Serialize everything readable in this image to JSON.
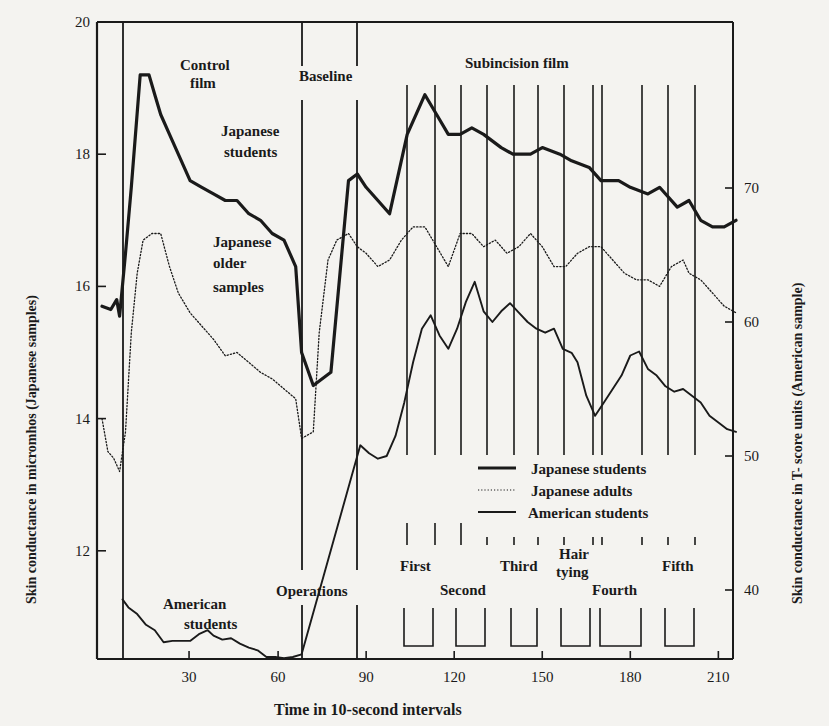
{
  "chart_data": {
    "type": "line",
    "title": "",
    "xlabel": "Time in 10-second intervals",
    "ylabel_left": "Skin conductance in micromhos (Japanese samples)",
    "ylabel_right": "Skin conductance in T- score units (American sample)",
    "x_ticks": [
      30,
      60,
      90,
      120,
      150,
      180,
      210
    ],
    "xlim": [
      0,
      216
    ],
    "y_left_ticks": [
      12,
      14,
      16,
      18,
      20
    ],
    "y_left_lim": [
      10.4,
      20
    ],
    "y_right_ticks": [
      40,
      50,
      60,
      70
    ],
    "y_right_lim": [
      35,
      82
    ],
    "grid": false,
    "legend_position": "center-right, inside plot",
    "legend": [
      {
        "label": "Japanese students",
        "style": "thick solid"
      },
      {
        "label": "Japanese adults",
        "style": "dotted"
      },
      {
        "label": "American students",
        "style": "thin solid"
      }
    ],
    "phase_markers_x": [
      7,
      68,
      87
    ],
    "segment_markers_x": [
      104,
      114,
      122,
      131,
      141,
      149,
      158,
      168,
      171,
      184,
      194,
      203
    ],
    "bottom_brackets": [
      [
        104,
        114
      ],
      [
        122,
        131
      ],
      [
        141,
        149
      ],
      [
        158,
        168
      ],
      [
        171,
        184
      ],
      [
        194,
        203
      ]
    ],
    "annotations": [
      {
        "text": "Control film",
        "lines": [
          "Control",
          "film"
        ]
      },
      {
        "text": "Japanese students",
        "lines": [
          "Japanese",
          "students"
        ]
      },
      {
        "text": "Japanese older samples",
        "lines": [
          "Japanese",
          "older",
          "samples"
        ]
      },
      {
        "text": "American students",
        "lines": [
          "American",
          "students"
        ]
      },
      {
        "text": "Baseline"
      },
      {
        "text": "Subincision film"
      },
      {
        "text": "Operations"
      },
      {
        "text": "First"
      },
      {
        "text": "Second"
      },
      {
        "text": "Third"
      },
      {
        "text": "Hair tying",
        "lines": [
          "Hair",
          "tying"
        ]
      },
      {
        "text": "Fourth"
      },
      {
        "text": "Fifth"
      }
    ],
    "series": [
      {
        "name": "Japanese students",
        "axis": "left",
        "unit": "micromhos",
        "x": [
          0,
          3,
          5,
          6,
          8,
          10,
          13,
          16,
          18,
          20,
          23,
          26,
          30,
          34,
          38,
          42,
          46,
          50,
          54,
          58,
          62,
          66,
          68,
          72,
          78,
          84,
          87,
          90,
          94,
          98,
          104,
          110,
          114,
          118,
          122,
          126,
          130,
          136,
          140,
          146,
          150,
          156,
          160,
          166,
          170,
          176,
          180,
          186,
          190,
          196,
          200,
          204,
          208,
          212,
          216
        ],
        "values": [
          15.7,
          15.65,
          15.8,
          15.55,
          16.5,
          17.5,
          19.2,
          19.2,
          18.9,
          18.6,
          18.3,
          18.0,
          17.6,
          17.5,
          17.4,
          17.3,
          17.3,
          17.1,
          17.0,
          16.8,
          16.7,
          16.3,
          15.0,
          14.5,
          14.7,
          17.6,
          17.7,
          17.5,
          17.3,
          17.1,
          18.3,
          18.9,
          18.6,
          18.3,
          18.3,
          18.4,
          18.3,
          18.1,
          18.0,
          18.0,
          18.1,
          18.0,
          17.9,
          17.8,
          17.6,
          17.6,
          17.5,
          17.4,
          17.5,
          17.2,
          17.3,
          17.0,
          16.9,
          16.9,
          17.0
        ]
      },
      {
        "name": "Japanese adults",
        "axis": "left",
        "unit": "micromhos",
        "x": [
          0,
          2,
          4,
          6,
          8,
          10,
          12,
          14,
          17,
          20,
          23,
          26,
          30,
          34,
          38,
          42,
          46,
          50,
          54,
          58,
          62,
          66,
          68,
          72,
          74,
          77,
          80,
          84,
          87,
          90,
          94,
          98,
          102,
          106,
          110,
          114,
          118,
          122,
          126,
          130,
          134,
          138,
          142,
          146,
          150,
          154,
          158,
          162,
          166,
          170,
          174,
          178,
          182,
          186,
          190,
          194,
          198,
          200,
          204,
          208,
          212,
          216
        ],
        "values": [
          14.0,
          13.5,
          13.4,
          13.2,
          13.8,
          15.3,
          16.2,
          16.7,
          16.8,
          16.8,
          16.3,
          15.9,
          15.6,
          15.4,
          15.2,
          14.95,
          15.0,
          14.85,
          14.7,
          14.6,
          14.45,
          14.3,
          13.7,
          13.8,
          15.3,
          16.4,
          16.7,
          16.8,
          16.6,
          16.5,
          16.3,
          16.4,
          16.7,
          16.9,
          16.9,
          16.6,
          16.3,
          16.8,
          16.8,
          16.6,
          16.7,
          16.5,
          16.6,
          16.8,
          16.6,
          16.3,
          16.3,
          16.5,
          16.6,
          16.6,
          16.4,
          16.2,
          16.1,
          16.1,
          16.0,
          16.3,
          16.4,
          16.2,
          16.1,
          15.9,
          15.7,
          15.6
        ]
      },
      {
        "name": "American students",
        "axis": "right",
        "unit": "T-score",
        "x": [
          7,
          9,
          12,
          15,
          18,
          21,
          24,
          27,
          30,
          33,
          36,
          38,
          41,
          44,
          47,
          50,
          53,
          56,
          59,
          62,
          65,
          68,
          88,
          91,
          94,
          97,
          100,
          103,
          106,
          109,
          112,
          115,
          118,
          121,
          124,
          127,
          130,
          133,
          136,
          139,
          142,
          145,
          148,
          151,
          154,
          157,
          160,
          162,
          165,
          168,
          171,
          174,
          177,
          180,
          183,
          186,
          189,
          192,
          195,
          198,
          201,
          204,
          207,
          210,
          213,
          216
        ],
        "values": [
          39.3,
          38.7,
          38.2,
          37.4,
          37.0,
          36.1,
          36.2,
          36.2,
          36.2,
          36.7,
          37.0,
          36.6,
          36.3,
          36.4,
          36.0,
          35.7,
          35.5,
          35.0,
          35.0,
          34.9,
          35.0,
          35.2,
          50.8,
          50.2,
          49.8,
          50.0,
          51.5,
          54.0,
          57.0,
          59.5,
          60.5,
          59.0,
          58.0,
          59.5,
          61.5,
          63.0,
          60.8,
          60.0,
          60.8,
          61.4,
          60.7,
          60.0,
          59.5,
          59.2,
          59.5,
          58.0,
          57.7,
          57.0,
          54.5,
          53.0,
          54.0,
          55.0,
          56.0,
          57.5,
          57.8,
          56.5,
          56.0,
          55.2,
          54.8,
          55.0,
          54.5,
          54.0,
          53.0,
          52.5,
          52.0,
          51.8
        ]
      }
    ]
  },
  "labels": {
    "control_film_1": "Control",
    "control_film_2": "film",
    "baseline": "Baseline",
    "subincision": "Subincision film",
    "jp_students_1": "Japanese",
    "jp_students_2": "students",
    "jp_older_1": "Japanese",
    "jp_older_2": "older",
    "jp_older_3": "samples",
    "am_students_1": "American",
    "am_students_2": "students",
    "operations": "Operations",
    "first": "First",
    "second": "Second",
    "third": "Third",
    "hair_1": "Hair",
    "hair_2": "tying",
    "fourth": "Fourth",
    "fifth": "Fifth",
    "legend_jp_students": "Japanese students",
    "legend_jp_adults": "Japanese adults",
    "legend_am_students": "American students"
  }
}
